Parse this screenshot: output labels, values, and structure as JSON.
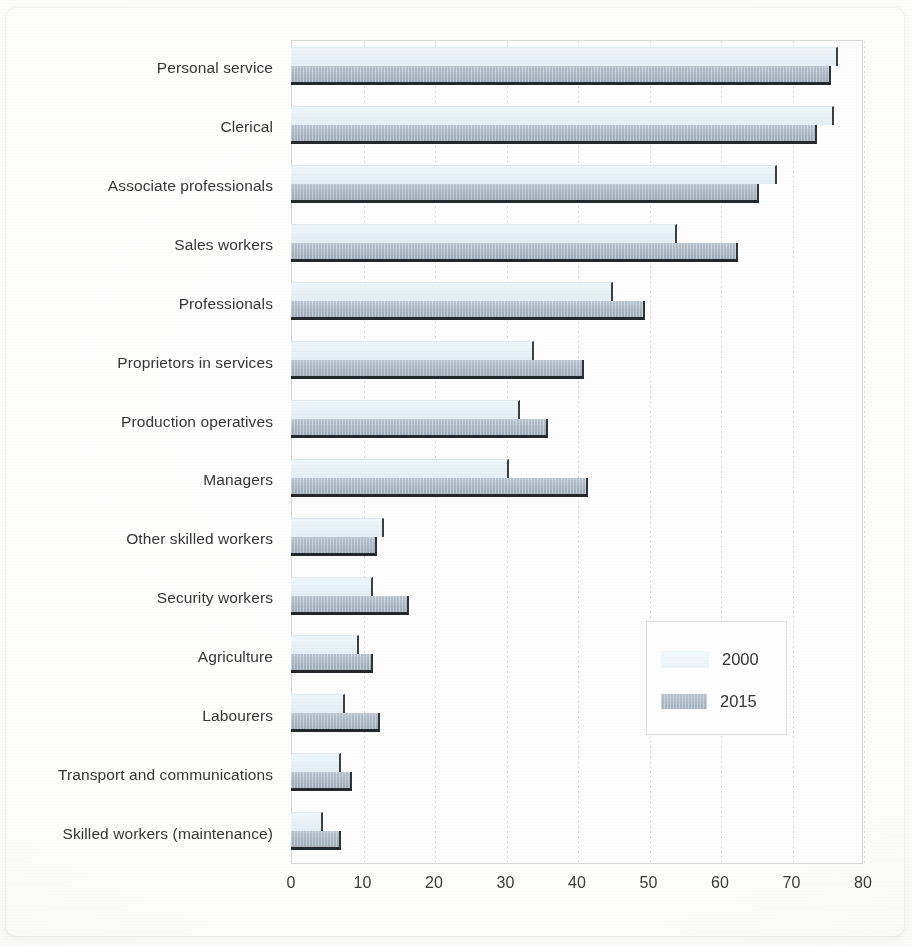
{
  "chart_data": {
    "type": "bar",
    "orientation": "horizontal",
    "title": "",
    "subtitle": "",
    "xlabel": "",
    "ylabel": "",
    "xlim": [
      0,
      80
    ],
    "xticks": [
      "0",
      "10",
      "20",
      "30",
      "40",
      "50",
      "60",
      "70",
      "80"
    ],
    "xtick_values": [
      0,
      10,
      20,
      30,
      40,
      50,
      60,
      70,
      80
    ],
    "grid": true,
    "grid_axis": "x",
    "legend_position": "center-right",
    "categories": [
      "Personal service",
      "Clerical",
      "Associate professionals",
      "Sales workers",
      "Professionals",
      "Proprietors in services",
      "Production operatives",
      "Managers",
      "Other skilled workers",
      "Security workers",
      "Agriculture",
      "Labourers",
      "Transport and communications",
      "Skilled workers (maintenance)"
    ],
    "series": [
      {
        "name": "2000",
        "color": "#e9f3f8",
        "values": [
          76.5,
          76,
          68,
          54,
          45,
          34,
          32,
          30.5,
          13,
          11.5,
          9.5,
          7.5,
          7,
          4.5
        ]
      },
      {
        "name": "2015",
        "color": "#a8b6c3",
        "values": [
          75.5,
          73.5,
          65.5,
          62.5,
          49.5,
          41,
          36,
          41.5,
          12,
          16.5,
          11.5,
          12.5,
          8.5,
          7
        ]
      }
    ]
  },
  "legend": {
    "entries": [
      {
        "label": "2000",
        "swatch": "swatch-2000-icon"
      },
      {
        "label": "2015",
        "swatch": "swatch-2015-icon"
      }
    ]
  }
}
